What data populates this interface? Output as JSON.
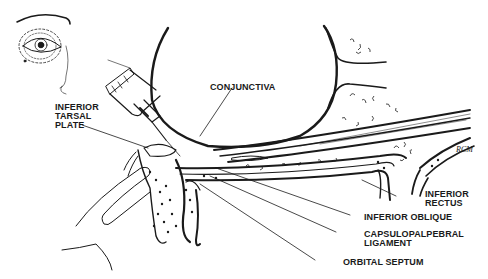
{
  "figure": {
    "inset": "Frontal view of eye with dashed injection region",
    "signature": "RCM"
  },
  "labels": {
    "conjunctiva": "CONJUNCTIVA",
    "inferior_tarsal_plate": [
      "INFERIOR",
      "TARSAL",
      "PLATE"
    ],
    "inferior_rectus": [
      "INFERIOR",
      "RECTUS"
    ],
    "inferior_oblique": "INFERIOR OBLIQUE",
    "capsulopalpebral_ligament": [
      "CAPSULOPALPEBRAL",
      "LIGAMENT"
    ],
    "orbital_septum": "ORBITAL SEPTUM"
  },
  "colors": {
    "ink": "#1a1a1a",
    "background": "#ffffff"
  }
}
